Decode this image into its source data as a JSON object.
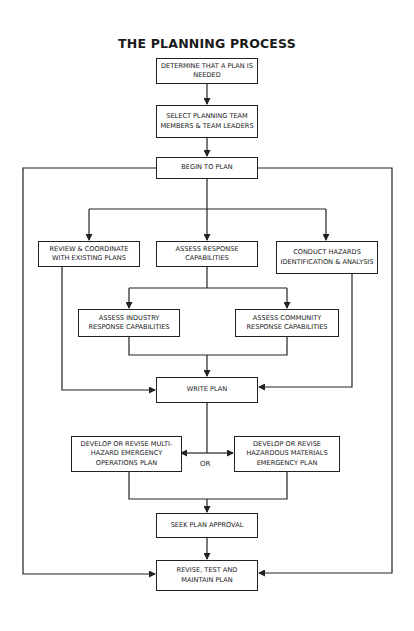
{
  "title": "THE PLANNING PROCESS",
  "nodes": {
    "determine": "DETERMINE THAT A PLAN IS NEEDED",
    "select": "SELECT PLANNING TEAM MEMBERS & TEAM LEADERS",
    "begin": "BEGIN TO PLAN",
    "review": "REVIEW & COORDINATE WITH EXISTING PLANS",
    "assess_response": "ASSESS RESPONSE CAPABILITIES",
    "conduct_hazards": "CONDUCT HAZARDS IDENTIFICATION & ANALYSIS",
    "assess_industry": "ASSESS INDUSTRY RESPONSE CAPABILITIES",
    "assess_community": "ASSESS COMMUNITY RESPONSE CAPABILITIES",
    "write": "WRITE PLAN",
    "multi_hazard": "DEVELOP OR REVISE MULTI-HAZARD EMERGENCY OPERATIONS PLAN",
    "hazmat": "DEVELOP OR REVISE HAZARDOUS MATERIALS EMERGENCY PLAN",
    "approval": "SEEK PLAN APPROVAL",
    "maintain": "REVISE, TEST AND MAINTAIN PLAN"
  },
  "labels": {
    "or": "OR"
  },
  "edges": [
    [
      "determine",
      "select"
    ],
    [
      "select",
      "begin"
    ],
    [
      "begin",
      "review"
    ],
    [
      "begin",
      "assess_response"
    ],
    [
      "begin",
      "conduct_hazards"
    ],
    [
      "begin",
      "maintain"
    ],
    [
      "assess_response",
      "assess_industry"
    ],
    [
      "assess_response",
      "assess_community"
    ],
    [
      "assess_industry",
      "write"
    ],
    [
      "assess_community",
      "write"
    ],
    [
      "review",
      "write"
    ],
    [
      "conduct_hazards",
      "write"
    ],
    [
      "write",
      "multi_hazard"
    ],
    [
      "write",
      "hazmat"
    ],
    [
      "multi_hazard",
      "approval"
    ],
    [
      "hazmat",
      "approval"
    ],
    [
      "approval",
      "maintain"
    ]
  ]
}
